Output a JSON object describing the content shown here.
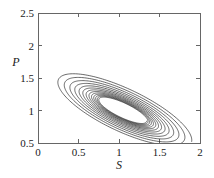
{
  "figure": {
    "width": 214,
    "height": 178,
    "background": "#ffffff",
    "line_color": "#1a1a1a",
    "axis_color": "#5a5a5a"
  },
  "chart_data": {
    "type": "line",
    "title": "",
    "xlabel": "S",
    "ylabel": "P",
    "xlim": [
      0,
      2
    ],
    "ylim": [
      0.5,
      2.5
    ],
    "xticks": [
      0,
      0.5,
      1,
      1.5,
      2
    ],
    "xtick_labels": [
      "0",
      "0.5",
      "1",
      "1.5",
      "2"
    ],
    "yticks": [
      0.5,
      1,
      1.5,
      2,
      2.5
    ],
    "ytick_labels": [
      "0.5",
      "1",
      "1.5",
      "2",
      "2.5"
    ],
    "grid": false,
    "legend": null,
    "annotations": [],
    "series": [
      {
        "name": "trajectory",
        "comment": "Inward spiral in the (S,P) phase plane, plotted as a decaying elliptical orbit tilted along the anti-diagonal.",
        "fixed_point": [
          1.05,
          1.0
        ],
        "start_point": [
          2.0,
          1.05
        ],
        "end_point": [
          1.05,
          1.0
        ],
        "turns": 13,
        "ellipse": {
          "center_s": 1.05,
          "center_p": 1.0,
          "tilt_degrees": -32,
          "initial_semi_major": 0.98,
          "initial_semi_minor": 0.33,
          "final_semi_major": 0.2,
          "final_semi_minor": 0.055,
          "decay_per_turn": 0.875,
          "start_angle_degrees": 8
        },
        "extrema": {
          "p_max": 2.0,
          "p_max_at_s": 0.5,
          "p_min": 0.68,
          "p_min_at_s": 1.45,
          "s_min": 0.3,
          "s_max": 2.0
        }
      }
    ]
  },
  "axes": {
    "plot_box": {
      "left": 38,
      "top": 13,
      "right": 200,
      "bottom": 143
    },
    "tick_length": 4,
    "tick_side": "inward"
  }
}
